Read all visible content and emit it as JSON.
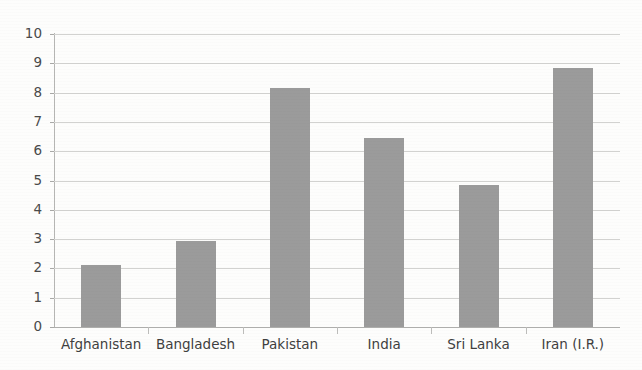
{
  "chart_data": {
    "type": "bar",
    "title": "",
    "subtitle": "",
    "xlabel": "",
    "ylabel": "",
    "categories": [
      "Afghanistan",
      "Bangladesh",
      "Pakistan",
      "India",
      "Sri Lanka",
      "Iran (I.R.)"
    ],
    "values": [
      2.1,
      2.95,
      8.15,
      6.45,
      4.85,
      8.85
    ],
    "ylim": [
      0,
      10
    ],
    "ytick_labels": [
      "10",
      "9",
      "8",
      "7",
      "6",
      "5",
      "4",
      "3",
      "2",
      "1",
      "0"
    ],
    "ytick_values": [
      10,
      9,
      8,
      7,
      6,
      5,
      4,
      3,
      2,
      1,
      0
    ],
    "ytick_step": 1,
    "grid": true,
    "grid_axis": "y",
    "legend": false,
    "legend_position": "none",
    "bar_color": "#9b9b9b",
    "grid_color": "#d2d2d0",
    "axis_color": "#b6b6b4",
    "text_color": "#3f3f3f",
    "background_color": "#fdfdfc",
    "annotations": []
  }
}
